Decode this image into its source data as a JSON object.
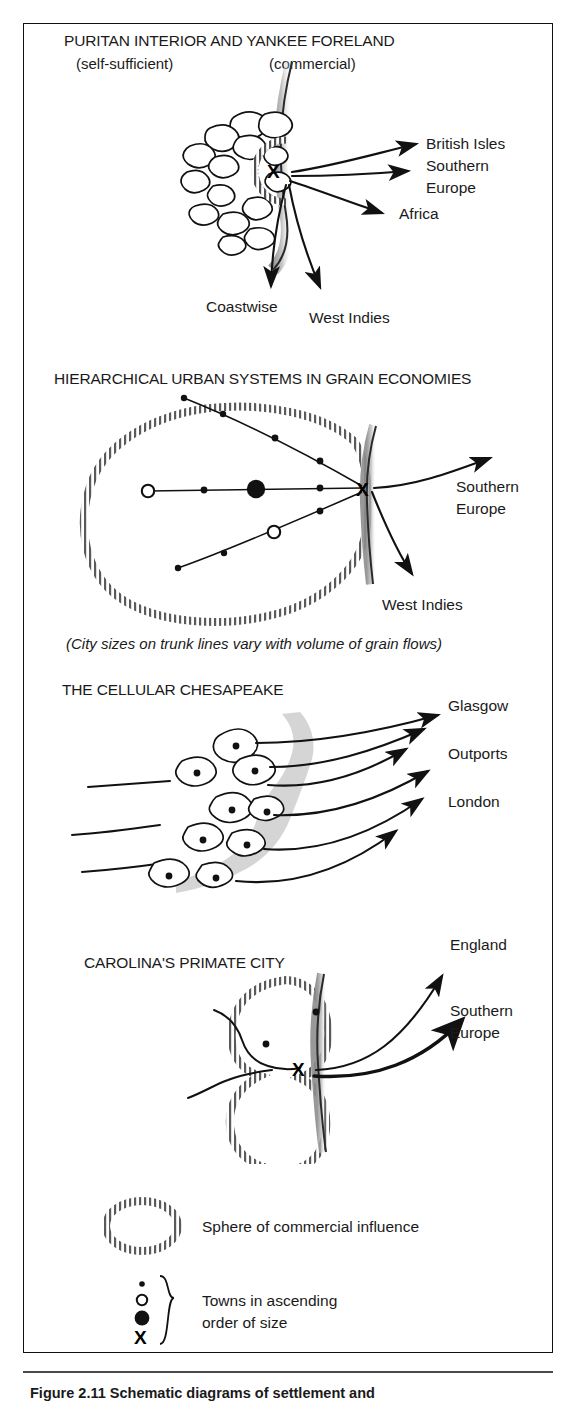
{
  "figure": {
    "caption": "Figure 2.11   Schematic diagrams of settlement and",
    "border_color": "#111111",
    "background": "#ffffff"
  },
  "panels": [
    {
      "id": "puritan",
      "title": "PURITAN INTERIOR AND YANKEE FORELAND",
      "subtitle_left": "(self-sufficient)",
      "subtitle_right": "(commercial)",
      "node_symbol": "X",
      "destinations": [
        {
          "label": "British Isles",
          "direction": "northeast"
        },
        {
          "label": "Southern",
          "direction": "east"
        },
        {
          "label": "Europe",
          "direction": "east"
        },
        {
          "label": "Africa",
          "direction": "east-southeast"
        },
        {
          "label": "Coastwise",
          "direction": "south"
        },
        {
          "label": "West Indies",
          "direction": "south-southeast"
        }
      ]
    },
    {
      "id": "grain",
      "title": "HIERARCHICAL URBAN SYSTEMS IN GRAIN ECONOMIES",
      "note": "(City sizes on trunk lines vary with volume of grain flows)",
      "node_symbol": "X",
      "destinations": [
        {
          "label": "Southern",
          "direction": "east"
        },
        {
          "label": "Europe",
          "direction": "east"
        },
        {
          "label": "West Indies",
          "direction": "south"
        }
      ]
    },
    {
      "id": "chesapeake",
      "title": "THE CELLULAR CHESAPEAKE",
      "destinations": [
        {
          "label": "Glasgow",
          "direction": "northeast"
        },
        {
          "label": "Outports",
          "direction": "east"
        },
        {
          "label": "London",
          "direction": "east-southeast"
        }
      ]
    },
    {
      "id": "carolina",
      "title": "CAROLINA'S PRIMATE CITY",
      "node_symbol": "X",
      "destinations": [
        {
          "label": "England",
          "direction": "northeast"
        },
        {
          "label": "Southern",
          "direction": "east-northeast"
        },
        {
          "label": "Europe",
          "direction": "east-northeast"
        }
      ]
    }
  ],
  "legend": {
    "items": [
      {
        "symbol": "dotted-ellipse",
        "label": "Sphere of commercial influence"
      },
      {
        "symbol": "town-sizes",
        "label_line1": "Towns in ascending",
        "label_line2": "order of size",
        "symbols": [
          "small-dot",
          "open-circle",
          "filled-circle",
          "X"
        ]
      }
    ]
  }
}
